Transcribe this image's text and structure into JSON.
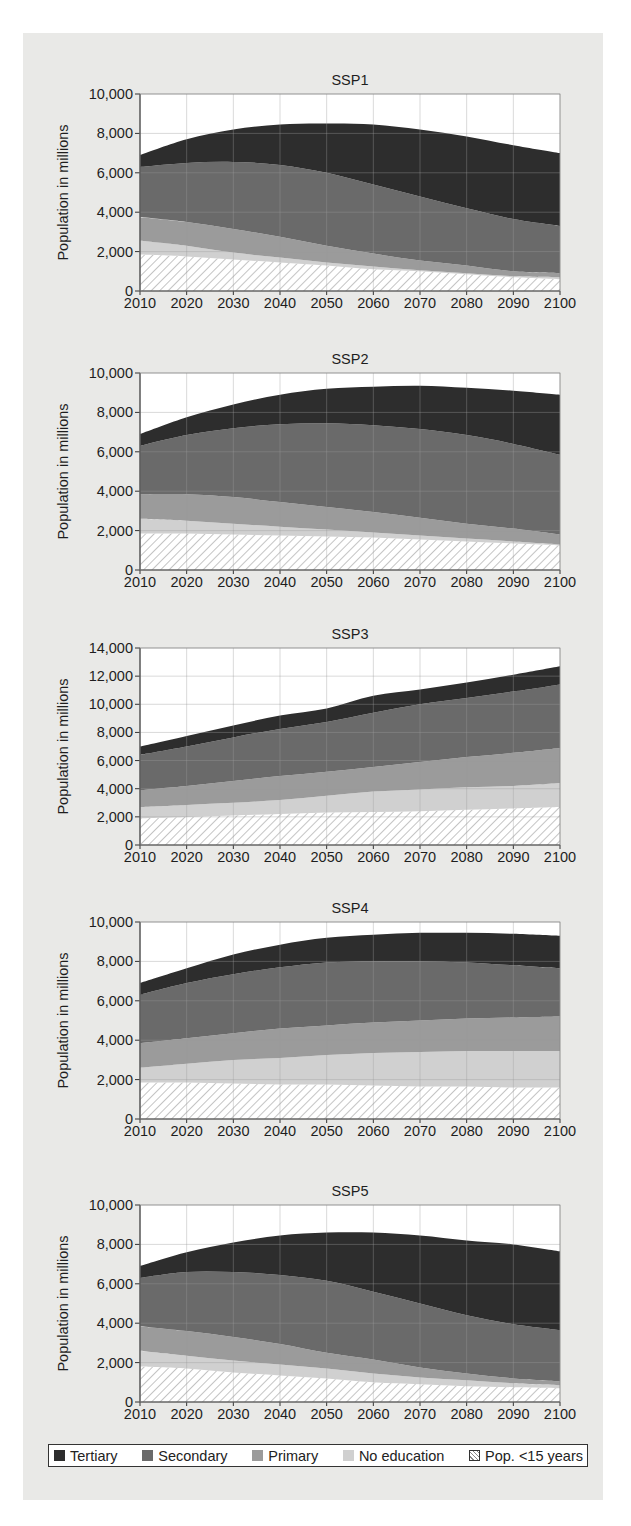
{
  "figure": {
    "legend": [
      {
        "key": "tertiary",
        "label": "Tertiary",
        "color": "#2d2d2d"
      },
      {
        "key": "secondary",
        "label": "Secondary",
        "color": "#6a6a6a"
      },
      {
        "key": "primary",
        "label": "Primary",
        "color": "#9b9b9b"
      },
      {
        "key": "no_education",
        "label": "No education",
        "color": "#d0d0d0"
      },
      {
        "key": "under15",
        "label": "Pop. <15 years",
        "color": "#ffffff",
        "pattern": "hatch"
      }
    ],
    "background": "#e9e9e7"
  },
  "chart_data": [
    {
      "type": "area",
      "stacked": true,
      "title": "SSP1",
      "xlabel": "",
      "ylabel": "Population in millions",
      "x": [
        2010,
        2020,
        2030,
        2040,
        2050,
        2060,
        2070,
        2080,
        2090,
        2100
      ],
      "ylim": [
        0,
        10000
      ],
      "yticks": [
        0,
        2000,
        4000,
        6000,
        8000,
        10000
      ],
      "ytick_labels": [
        "0",
        "2,000",
        "4,000",
        "6,000",
        "8,000",
        "10,000"
      ],
      "grid": true,
      "legend_position": "bottom",
      "series": [
        {
          "name": "Pop. <15 years",
          "values": [
            1850,
            1750,
            1600,
            1450,
            1300,
            1100,
            1000,
            850,
            700,
            600
          ]
        },
        {
          "name": "No education",
          "values": [
            700,
            550,
            350,
            250,
            150,
            150,
            50,
            50,
            50,
            100
          ]
        },
        {
          "name": "Primary",
          "values": [
            1200,
            1200,
            1200,
            1050,
            850,
            650,
            500,
            400,
            250,
            200
          ]
        },
        {
          "name": "Secondary",
          "values": [
            2550,
            3000,
            3400,
            3650,
            3700,
            3500,
            3250,
            2900,
            2650,
            2400
          ]
        },
        {
          "name": "Tertiary",
          "values": [
            600,
            1200,
            1650,
            2050,
            2500,
            3050,
            3400,
            3650,
            3750,
            3700
          ]
        }
      ],
      "totals": [
        6900,
        7700,
        8200,
        8450,
        8500,
        8450,
        8200,
        7850,
        7400,
        7000
      ]
    },
    {
      "type": "area",
      "stacked": true,
      "title": "SSP2",
      "xlabel": "",
      "ylabel": "Population in millions",
      "x": [
        2010,
        2020,
        2030,
        2040,
        2050,
        2060,
        2070,
        2080,
        2090,
        2100
      ],
      "ylim": [
        0,
        10000
      ],
      "yticks": [
        0,
        2000,
        4000,
        6000,
        8000,
        10000
      ],
      "ytick_labels": [
        "0",
        "2,000",
        "4,000",
        "6,000",
        "8,000",
        "10,000"
      ],
      "grid": true,
      "legend_position": "bottom",
      "series": [
        {
          "name": "Pop. <15 years",
          "values": [
            1850,
            1850,
            1800,
            1750,
            1700,
            1650,
            1550,
            1450,
            1350,
            1250
          ]
        },
        {
          "name": "No education",
          "values": [
            750,
            650,
            550,
            450,
            350,
            250,
            200,
            150,
            100,
            50
          ]
        },
        {
          "name": "Primary",
          "values": [
            1250,
            1350,
            1350,
            1250,
            1150,
            1050,
            900,
            750,
            650,
            500
          ]
        },
        {
          "name": "Secondary",
          "values": [
            2450,
            3000,
            3500,
            3950,
            4250,
            4400,
            4500,
            4500,
            4300,
            4050
          ]
        },
        {
          "name": "Tertiary",
          "values": [
            600,
            900,
            1200,
            1500,
            1750,
            1950,
            2200,
            2400,
            2700,
            3050
          ]
        }
      ],
      "totals": [
        6900,
        7750,
        8400,
        8900,
        9200,
        9300,
        9350,
        9250,
        9100,
        8900
      ]
    },
    {
      "type": "area",
      "stacked": true,
      "title": "SSP3",
      "xlabel": "",
      "ylabel": "Population in millions",
      "x": [
        2010,
        2020,
        2030,
        2040,
        2050,
        2060,
        2070,
        2080,
        2090,
        2100
      ],
      "ylim": [
        0,
        14000
      ],
      "yticks": [
        0,
        2000,
        4000,
        6000,
        8000,
        10000,
        12000,
        14000
      ],
      "ytick_labels": [
        "0",
        "2,000",
        "4,000",
        "6,000",
        "8,000",
        "10,000",
        "12,000",
        "14,000"
      ],
      "grid": true,
      "legend_position": "bottom",
      "series": [
        {
          "name": "Pop. <15 years",
          "values": [
            1900,
            2000,
            2100,
            2200,
            2300,
            2350,
            2400,
            2500,
            2600,
            2700
          ]
        },
        {
          "name": "No education",
          "values": [
            800,
            850,
            900,
            1000,
            1200,
            1450,
            1550,
            1600,
            1600,
            1700
          ]
        },
        {
          "name": "Primary",
          "values": [
            1200,
            1350,
            1550,
            1700,
            1700,
            1750,
            1950,
            2150,
            2350,
            2500
          ]
        },
        {
          "name": "Secondary",
          "values": [
            2500,
            2800,
            3100,
            3350,
            3550,
            3850,
            4100,
            4200,
            4350,
            4500
          ]
        },
        {
          "name": "Tertiary",
          "values": [
            600,
            750,
            850,
            950,
            950,
            1200,
            1050,
            1100,
            1200,
            1300
          ]
        }
      ],
      "totals": [
        7000,
        7750,
        8500,
        9200,
        9700,
        10600,
        11050,
        11550,
        12100,
        12700
      ]
    },
    {
      "type": "area",
      "stacked": true,
      "title": "SSP4",
      "xlabel": "",
      "ylabel": "Population in millions",
      "x": [
        2010,
        2020,
        2030,
        2040,
        2050,
        2060,
        2070,
        2080,
        2090,
        2100
      ],
      "ylim": [
        0,
        10000
      ],
      "yticks": [
        0,
        2000,
        4000,
        6000,
        8000,
        10000
      ],
      "ytick_labels": [
        "0",
        "2,000",
        "4,000",
        "6,000",
        "8,000",
        "10,000"
      ],
      "grid": true,
      "legend_position": "bottom",
      "series": [
        {
          "name": "Pop. <15 years",
          "values": [
            1850,
            1850,
            1800,
            1750,
            1750,
            1700,
            1650,
            1650,
            1600,
            1600
          ]
        },
        {
          "name": "No education",
          "values": [
            750,
            950,
            1200,
            1350,
            1500,
            1650,
            1750,
            1800,
            1850,
            1850
          ]
        },
        {
          "name": "Primary",
          "values": [
            1250,
            1300,
            1350,
            1500,
            1500,
            1550,
            1600,
            1650,
            1700,
            1750
          ]
        },
        {
          "name": "Secondary",
          "values": [
            2450,
            2800,
            3000,
            3100,
            3200,
            3100,
            3000,
            2850,
            2650,
            2450
          ]
        },
        {
          "name": "Tertiary",
          "values": [
            600,
            750,
            1000,
            1150,
            1250,
            1350,
            1450,
            1500,
            1600,
            1650
          ]
        }
      ],
      "totals": [
        6900,
        7650,
        8350,
        8850,
        9200,
        9350,
        9450,
        9450,
        9400,
        9300
      ]
    },
    {
      "type": "area",
      "stacked": true,
      "title": "SSP5",
      "xlabel": "",
      "ylabel": "Population in millions",
      "x": [
        2010,
        2020,
        2030,
        2040,
        2050,
        2060,
        2070,
        2080,
        2090,
        2100
      ],
      "ylim": [
        0,
        10000
      ],
      "yticks": [
        0,
        2000,
        4000,
        6000,
        8000,
        10000
      ],
      "ytick_labels": [
        "0",
        "2,000",
        "4,000",
        "6,000",
        "8,000",
        "10,000"
      ],
      "grid": true,
      "legend_position": "bottom",
      "series": [
        {
          "name": "Pop. <15 years",
          "values": [
            1800,
            1700,
            1500,
            1350,
            1200,
            1000,
            900,
            800,
            750,
            700
          ]
        },
        {
          "name": "No education",
          "values": [
            800,
            650,
            600,
            550,
            500,
            450,
            350,
            300,
            200,
            150
          ]
        },
        {
          "name": "Primary",
          "values": [
            1250,
            1250,
            1200,
            1050,
            800,
            700,
            500,
            350,
            250,
            200
          ]
        },
        {
          "name": "Secondary",
          "values": [
            2450,
            3000,
            3300,
            3500,
            3650,
            3450,
            3250,
            2950,
            2750,
            2600
          ]
        },
        {
          "name": "Tertiary",
          "values": [
            600,
            1000,
            1500,
            2000,
            2450,
            3000,
            3450,
            3800,
            4050,
            4000
          ]
        }
      ],
      "totals": [
        6900,
        7600,
        8100,
        8450,
        8600,
        8600,
        8450,
        8200,
        8000,
        7650
      ]
    }
  ]
}
